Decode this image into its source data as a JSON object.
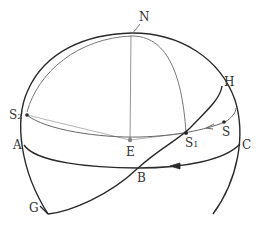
{
  "diagram": {
    "type": "celestial-sphere",
    "colors": {
      "outline": "#2a2a2a",
      "thin_line": "#777777",
      "label": "#333333",
      "background": "#ffffff"
    },
    "labels": {
      "N": "N",
      "H": "H",
      "S2_main": "S",
      "S2_sub": "2",
      "A": "A",
      "E": "E",
      "S1_main": "S",
      "S1_sub": "1",
      "S": "S",
      "C": "C",
      "B": "B",
      "G": "G"
    },
    "points": {
      "N": [
        132,
        34
      ],
      "H": [
        222,
        86
      ],
      "S2": [
        27,
        115
      ],
      "A": [
        24,
        145
      ],
      "E": [
        130,
        140
      ],
      "S1": [
        186,
        133
      ],
      "S": [
        224,
        122
      ],
      "C": [
        240,
        144
      ],
      "B": [
        138,
        168
      ],
      "G": [
        46,
        214
      ]
    },
    "curves": [
      "sphere-outline",
      "meridian-N-S2-S1",
      "line-N-E",
      "line-S2-E-S1",
      "diurnal-path-S2-S1-S",
      "equator-A-B-C",
      "ecliptic-G-B-S1-H"
    ]
  }
}
